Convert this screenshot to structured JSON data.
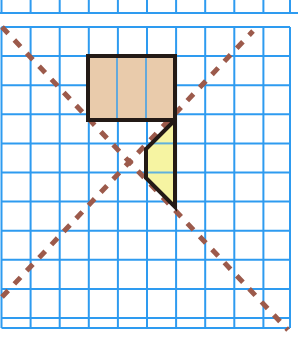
{
  "canvas": {
    "width": 298,
    "height": 342,
    "background": "#ffffff",
    "title": "Grid with shaded rectangle, yellow triangle and two dashed diagonal lines of symmetry"
  },
  "colors": {
    "grid_line": "#2e9bf0",
    "grid_line_light": "#4fb0f5",
    "shape_outline": "#231a16",
    "rectangle_fill": "#e9cbab",
    "triangle_fill": "#f6f4a2",
    "dashed_line": "#9c5a4b",
    "page_background": "#ffffff"
  },
  "grid": {
    "label": "square-grid",
    "cell_size": 29.1,
    "origin_x": 1.5,
    "origin_y": 27.0,
    "columns": 10,
    "rows": 10,
    "stroke_width": 2.0,
    "top_partial_row": {
      "visible": true,
      "bottom_y": 13.0
    },
    "vertical_line_x": [
      1.5,
      30.6,
      59.7,
      88.8,
      117.9,
      147.0,
      176.1,
      205.2,
      234.3,
      263.4,
      290.0
    ],
    "horizontal_line_y": [
      27.0,
      56.1,
      85.2,
      114.3,
      143.4,
      172.5,
      201.6,
      230.7,
      259.8,
      288.9,
      318.0,
      328.0
    ]
  },
  "shapes": {
    "rectangle": {
      "label": "tan-rectangle",
      "fill": "#e9cbab",
      "stroke": "#231a16",
      "stroke_width": 4.0,
      "x": 88.0,
      "y": 56.0,
      "width": 87.0,
      "height": 64.0,
      "cells_wide": 3,
      "cells_tall": 2,
      "interior_grid_x": [
        117.0,
        146.0
      ],
      "interior_grid_y": []
    },
    "triangle": {
      "label": "yellow-triangle",
      "fill": "#f6f4a2",
      "stroke": "#231a16",
      "stroke_width": 4.0,
      "points": [
        {
          "x": 175.0,
          "y": 120.0
        },
        {
          "x": 146.0,
          "y": 149.0
        },
        {
          "x": 146.0,
          "y": 178.0
        },
        {
          "x": 175.0,
          "y": 207.0
        }
      ],
      "points_string": "175,120 146,149 146,178 175,207",
      "interior_grid_y": [
        143.4,
        172.5
      ]
    }
  },
  "dashed_lines": [
    {
      "label": "diagonal-descending",
      "color": "#9c5a4b",
      "stroke_width": 5.0,
      "dash_pattern": "9 9",
      "x1": 2.0,
      "y1": 27.0,
      "x2": 288.0,
      "y2": 330.0
    },
    {
      "label": "diagonal-ascending",
      "color": "#9c5a4b",
      "stroke_width": 5.0,
      "dash_pattern": "9 9",
      "x1": 2.0,
      "y1": 297.0,
      "x2": 253.0,
      "y2": 31.0
    }
  ]
}
